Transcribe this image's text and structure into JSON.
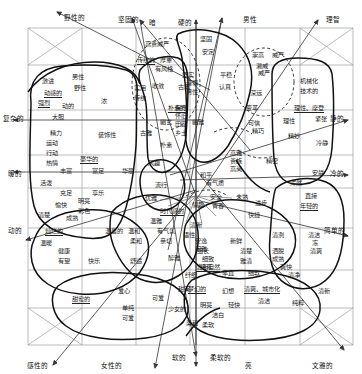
{
  "diagram": {
    "type": "image-scale-map",
    "title_semantics": "color/word image scale chart",
    "grid": {
      "cols": 6,
      "rows": 8,
      "line_color": "#9a9a9a"
    },
    "axes": {
      "top": [
        {
          "label": "野性的",
          "x": 64,
          "y": 12,
          "arrow": "up-left"
        },
        {
          "label": "坚固的",
          "x": 118,
          "y": 14,
          "arrow": "up-right"
        },
        {
          "label": "暗",
          "x": 149,
          "y": 17
        },
        {
          "label": "硬的",
          "x": 178,
          "y": 17
        },
        {
          "label": "男性",
          "x": 243,
          "y": 14,
          "arrow": "up"
        },
        {
          "label": "理智",
          "x": 326,
          "y": 14,
          "arrow": "up-right"
        }
      ],
      "bottom": [
        {
          "label": "感性的",
          "x": 27,
          "y": 360,
          "arrow": "down-left"
        },
        {
          "label": "女性的",
          "x": 101,
          "y": 360,
          "arrow": "down"
        },
        {
          "label": "软的",
          "x": 172,
          "y": 352
        },
        {
          "label": "柔软的",
          "x": 210,
          "y": 352
        },
        {
          "label": "亮",
          "x": 245,
          "y": 360
        },
        {
          "label": "文雅的",
          "x": 312,
          "y": 360,
          "arrow": "down-right"
        }
      ],
      "left": [
        {
          "label": "复杂的",
          "x": 3,
          "y": 113,
          "arrow": "left"
        },
        {
          "label": "暖的",
          "x": 8,
          "y": 168,
          "arrow": "left"
        },
        {
          "label": "动的",
          "x": 8,
          "y": 225,
          "arrow": "down-left"
        }
      ],
      "right": [
        {
          "label": "静的",
          "x": 330,
          "y": 113,
          "arrow": "right"
        },
        {
          "label": "冷的",
          "x": 330,
          "y": 168,
          "arrow": "right"
        },
        {
          "label": "简单的",
          "x": 324,
          "y": 225,
          "arrow": "down-right"
        }
      ]
    },
    "words": [
      {
        "t": "高贵威严",
        "x": 145,
        "y": 41
      },
      {
        "t": "坚固",
        "x": 200,
        "y": 36
      },
      {
        "t": "安定",
        "x": 202,
        "y": 49
      },
      {
        "t": "传统的",
        "x": 137,
        "y": 57,
        "u": true
      },
      {
        "t": "厚重",
        "x": 160,
        "y": 57
      },
      {
        "t": "有风格",
        "x": 155,
        "y": 66
      },
      {
        "t": "崇高",
        "x": 252,
        "y": 52
      },
      {
        "t": "威严",
        "x": 272,
        "y": 52
      },
      {
        "t": "濑威",
        "x": 256,
        "y": 63
      },
      {
        "t": "威严",
        "x": 258,
        "y": 70
      },
      {
        "t": "坚实",
        "x": 182,
        "y": 72
      },
      {
        "t": "平稳",
        "x": 220,
        "y": 72
      },
      {
        "t": "激进",
        "x": 42,
        "y": 78
      },
      {
        "t": "男性",
        "x": 72,
        "y": 74
      },
      {
        "t": "野性",
        "x": 74,
        "y": 85
      },
      {
        "t": "动感的",
        "x": 44,
        "y": 90,
        "u": true
      },
      {
        "t": "强烈",
        "x": 38,
        "y": 100,
        "u": true
      },
      {
        "t": "动的",
        "x": 62,
        "y": 103
      },
      {
        "t": "大胆",
        "x": 52,
        "y": 114
      },
      {
        "t": "浓",
        "x": 101,
        "y": 98
      },
      {
        "t": "实用",
        "x": 134,
        "y": 85
      },
      {
        "t": "传统",
        "x": 134,
        "y": 95
      },
      {
        "t": "古典",
        "x": 178,
        "y": 84
      },
      {
        "t": "收敛",
        "x": 152,
        "y": 83
      },
      {
        "t": "谨慎",
        "x": 186,
        "y": 80
      },
      {
        "t": "男性",
        "x": 186,
        "y": 89
      },
      {
        "t": "认真",
        "x": 219,
        "y": 84
      },
      {
        "t": "深远",
        "x": 250,
        "y": 90
      },
      {
        "t": "机械化",
        "x": 300,
        "y": 78
      },
      {
        "t": "技术的",
        "x": 300,
        "y": 88
      },
      {
        "t": "保守",
        "x": 175,
        "y": 105
      },
      {
        "t": "怀旧",
        "x": 175,
        "y": 113
      },
      {
        "t": "田园",
        "x": 175,
        "y": 121
      },
      {
        "t": "朴素的",
        "x": 168,
        "y": 105,
        "u": true
      },
      {
        "t": "幽玄",
        "x": 160,
        "y": 119
      },
      {
        "t": "幽雅",
        "x": 192,
        "y": 119
      },
      {
        "t": "变革",
        "x": 246,
        "y": 105
      },
      {
        "t": "理性、摩登",
        "x": 294,
        "y": 105,
        "u": true
      },
      {
        "t": "紧张",
        "x": 315,
        "y": 116
      },
      {
        "t": "理性",
        "x": 283,
        "y": 118
      },
      {
        "t": "可信",
        "x": 248,
        "y": 120
      },
      {
        "t": "精力",
        "x": 50,
        "y": 130
      },
      {
        "t": "运动",
        "x": 46,
        "y": 140
      },
      {
        "t": "行动",
        "x": 46,
        "y": 150
      },
      {
        "t": "热情",
        "x": 46,
        "y": 160
      },
      {
        "t": "装饰性",
        "x": 98,
        "y": 132
      },
      {
        "t": "古雅",
        "x": 140,
        "y": 130
      },
      {
        "t": "乡土",
        "x": 175,
        "y": 130
      },
      {
        "t": "朴素",
        "x": 160,
        "y": 142
      },
      {
        "t": "精巧",
        "x": 252,
        "y": 128
      },
      {
        "t": "精妙",
        "x": 288,
        "y": 133
      },
      {
        "t": "冷静",
        "x": 316,
        "y": 140
      },
      {
        "t": "豪华的",
        "x": 80,
        "y": 156,
        "u": true
      },
      {
        "t": "丰富",
        "x": 60,
        "y": 168
      },
      {
        "t": "富足",
        "x": 92,
        "y": 168
      },
      {
        "t": "华丽",
        "x": 122,
        "y": 168
      },
      {
        "t": "风趣",
        "x": 148,
        "y": 160
      },
      {
        "t": "高雅",
        "x": 230,
        "y": 150
      },
      {
        "t": "贵族",
        "x": 230,
        "y": 158
      },
      {
        "t": "高尚",
        "x": 230,
        "y": 166
      },
      {
        "t": "精密",
        "x": 266,
        "y": 158
      },
      {
        "t": "安静",
        "x": 312,
        "y": 170
      },
      {
        "t": "和平",
        "x": 200,
        "y": 172
      },
      {
        "t": "有气质",
        "x": 206,
        "y": 180
      },
      {
        "t": "活泼",
        "x": 40,
        "y": 180
      },
      {
        "t": "充足",
        "x": 60,
        "y": 190
      },
      {
        "t": "享乐",
        "x": 92,
        "y": 190
      },
      {
        "t": "流行",
        "x": 155,
        "y": 182
      },
      {
        "t": "优雅",
        "x": 145,
        "y": 195
      },
      {
        "t": "浑然",
        "x": 290,
        "y": 180
      },
      {
        "t": "愉快",
        "x": 55,
        "y": 202
      },
      {
        "t": "明亮",
        "x": 78,
        "y": 198
      },
      {
        "t": "彩色",
        "x": 78,
        "y": 208
      },
      {
        "t": "清楚",
        "x": 38,
        "y": 212
      },
      {
        "t": "成熟",
        "x": 66,
        "y": 215
      },
      {
        "t": "时代感的",
        "x": 160,
        "y": 208,
        "u": true
      },
      {
        "t": "温雅",
        "x": 150,
        "y": 218
      },
      {
        "t": "青春",
        "x": 212,
        "y": 203
      },
      {
        "t": "安全",
        "x": 210,
        "y": 194
      },
      {
        "t": "未熟",
        "x": 236,
        "y": 194
      },
      {
        "t": "进步",
        "x": 255,
        "y": 200
      },
      {
        "t": "直接",
        "x": 305,
        "y": 193
      },
      {
        "t": "年轻的",
        "x": 300,
        "y": 203,
        "u": true
      },
      {
        "t": "快捷",
        "x": 248,
        "y": 212
      },
      {
        "t": "情趣",
        "x": 192,
        "y": 202
      },
      {
        "t": "灿烂的",
        "x": 45,
        "y": 228,
        "u": true
      },
      {
        "t": "温暖",
        "x": 40,
        "y": 240
      },
      {
        "t": "温馨的",
        "x": 105,
        "y": 228
      },
      {
        "t": "温和",
        "x": 128,
        "y": 228
      },
      {
        "t": "柔和",
        "x": 130,
        "y": 238
      },
      {
        "t": "有气氛",
        "x": 157,
        "y": 228
      },
      {
        "t": "亲切",
        "x": 160,
        "y": 238
      },
      {
        "t": "清新",
        "x": 190,
        "y": 222
      },
      {
        "t": "语性",
        "x": 183,
        "y": 232
      },
      {
        "t": "安逸",
        "x": 195,
        "y": 238
      },
      {
        "t": "闲雅",
        "x": 195,
        "y": 246
      },
      {
        "t": "新鲜",
        "x": 230,
        "y": 238
      },
      {
        "t": "细长",
        "x": 197,
        "y": 248
      },
      {
        "t": "清洌",
        "x": 272,
        "y": 232
      },
      {
        "t": "清洁",
        "x": 308,
        "y": 232
      },
      {
        "t": "冻",
        "x": 312,
        "y": 240
      },
      {
        "t": "清爽",
        "x": 310,
        "y": 248
      },
      {
        "t": "健康",
        "x": 58,
        "y": 248
      },
      {
        "t": "有望",
        "x": 58,
        "y": 258
      },
      {
        "t": "快乐",
        "x": 88,
        "y": 258
      },
      {
        "t": "舒适",
        "x": 130,
        "y": 258
      },
      {
        "t": "醇雅",
        "x": 168,
        "y": 255
      },
      {
        "t": "细致",
        "x": 202,
        "y": 256
      },
      {
        "t": "纯真",
        "x": 200,
        "y": 264
      },
      {
        "t": "清新自然",
        "x": 196,
        "y": 264,
        "u": true
      },
      {
        "t": "清楚",
        "x": 240,
        "y": 248
      },
      {
        "t": "雅清",
        "x": 240,
        "y": 258
      },
      {
        "t": "洒脱",
        "x": 272,
        "y": 248
      },
      {
        "t": "成熟",
        "x": 272,
        "y": 256
      },
      {
        "t": "爽快",
        "x": 280,
        "y": 264
      },
      {
        "t": "率直",
        "x": 222,
        "y": 270
      },
      {
        "t": "细软",
        "x": 248,
        "y": 270
      },
      {
        "t": "纤细",
        "x": 185,
        "y": 272
      },
      {
        "t": "清净",
        "x": 288,
        "y": 272
      },
      {
        "t": "爱心",
        "x": 118,
        "y": 288
      },
      {
        "t": "甜蜜的",
        "x": 72,
        "y": 296,
        "u": true
      },
      {
        "t": "可爱",
        "x": 152,
        "y": 295
      },
      {
        "t": "甜美",
        "x": 178,
        "y": 286
      },
      {
        "t": "梦幻的",
        "x": 188,
        "y": 286,
        "u": true
      },
      {
        "t": "幻想",
        "x": 222,
        "y": 288
      },
      {
        "t": "清爽、城市化",
        "x": 244,
        "y": 286,
        "u": true
      },
      {
        "t": "清洁",
        "x": 258,
        "y": 298
      },
      {
        "t": "纯粹",
        "x": 292,
        "y": 300
      },
      {
        "t": "清新",
        "x": 318,
        "y": 288
      },
      {
        "t": "单纯",
        "x": 122,
        "y": 305
      },
      {
        "t": "可爱",
        "x": 122,
        "y": 315
      },
      {
        "t": "少女的",
        "x": 168,
        "y": 306
      },
      {
        "t": "明亮",
        "x": 200,
        "y": 302
      },
      {
        "t": "轻快",
        "x": 228,
        "y": 302
      },
      {
        "t": "洁白",
        "x": 212,
        "y": 312
      },
      {
        "t": "柔和",
        "x": 186,
        "y": 320
      },
      {
        "t": "柔软",
        "x": 202,
        "y": 322
      }
    ]
  }
}
